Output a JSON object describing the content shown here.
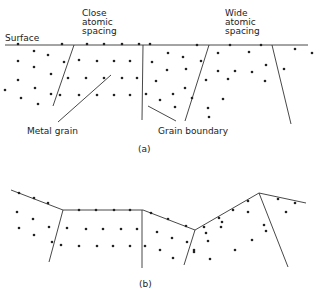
{
  "figure": {
    "panel_a": {
      "caption": "(a)",
      "labels": {
        "surface": "Surface",
        "close_spacing": [
          "Close",
          "atomic",
          "spacing"
        ],
        "wide_spacing": [
          "Wide",
          "atomic",
          "spacing"
        ],
        "metal_grain": "Metal grain",
        "grain_boundary": "Grain boundary"
      },
      "surface_line": [
        [
          5,
          45
        ],
        [
          308,
          45
        ]
      ],
      "boundaries": [
        [
          [
            74,
            45
          ],
          [
            53,
            106
          ]
        ],
        [
          [
            143,
            45
          ],
          [
            142,
            120
          ]
        ],
        [
          [
            209,
            45
          ],
          [
            185,
            121
          ]
        ],
        [
          [
            272,
            45
          ],
          [
            291,
            124
          ]
        ]
      ],
      "leaders": [
        [
          [
            111,
            75
          ],
          [
            58,
            122
          ]
        ],
        [
          [
            148,
            106
          ],
          [
            176,
            121
          ]
        ]
      ],
      "dots": [
        [
          18,
          44
        ],
        [
          62,
          44
        ],
        [
          87,
          44
        ],
        [
          104,
          44
        ],
        [
          122,
          44
        ],
        [
          139,
          44
        ],
        [
          150,
          44
        ],
        [
          197,
          45
        ],
        [
          230,
          45
        ],
        [
          261,
          45
        ],
        [
          34,
          51
        ],
        [
          48,
          55
        ],
        [
          18,
          61
        ],
        [
          34,
          67
        ],
        [
          64,
          62
        ],
        [
          79,
          60
        ],
        [
          97,
          61
        ],
        [
          114,
          61
        ],
        [
          130,
          61
        ],
        [
          152,
          62
        ],
        [
          168,
          53
        ],
        [
          183,
          57
        ],
        [
          201,
          61
        ],
        [
          218,
          53
        ],
        [
          249,
          52
        ],
        [
          295,
          49
        ],
        [
          312,
          53
        ],
        [
          51,
          74
        ],
        [
          68,
          78
        ],
        [
          86,
          78
        ],
        [
          104,
          78
        ],
        [
          122,
          78
        ],
        [
          137,
          78
        ],
        [
          167,
          70
        ],
        [
          186,
          69
        ],
        [
          218,
          71
        ],
        [
          235,
          71
        ],
        [
          266,
          65
        ],
        [
          284,
          69
        ],
        [
          18,
          80
        ],
        [
          35,
          88
        ],
        [
          5,
          90
        ],
        [
          21,
          98
        ],
        [
          51,
          94
        ],
        [
          60,
          95
        ],
        [
          79,
          95
        ],
        [
          97,
          95
        ],
        [
          114,
          95
        ],
        [
          130,
          95
        ],
        [
          146,
          94
        ],
        [
          156,
          81
        ],
        [
          173,
          94
        ],
        [
          185,
          88
        ],
        [
          206,
          80
        ],
        [
          228,
          79
        ],
        [
          252,
          72
        ],
        [
          265,
          81
        ],
        [
          38,
          104
        ],
        [
          160,
          100
        ],
        [
          175,
          107
        ],
        [
          192,
          98
        ],
        [
          208,
          108
        ],
        [
          223,
          99
        ],
        [
          209,
          117
        ]
      ]
    },
    "panel_b": {
      "caption": "(b)",
      "surface_polyline": [
        [
          11,
          190
        ],
        [
          63,
          210
        ],
        [
          143,
          210
        ],
        [
          195,
          230
        ],
        [
          259,
          193
        ],
        [
          306,
          203
        ]
      ],
      "boundaries": [
        [
          [
            63,
            210
          ],
          [
            49,
            262
          ]
        ],
        [
          [
            142,
            210
          ],
          [
            142,
            268
          ]
        ],
        [
          [
            195,
            230
          ],
          [
            184,
            265
          ]
        ],
        [
          [
            259,
            193
          ],
          [
            288,
            267
          ]
        ]
      ],
      "dots": [
        [
          19,
          193
        ],
        [
          34,
          198
        ],
        [
          48,
          203
        ],
        [
          79,
          210
        ],
        [
          96,
          210
        ],
        [
          114,
          210
        ],
        [
          130,
          210
        ],
        [
          151,
          213
        ],
        [
          168,
          219
        ],
        [
          186,
          226
        ],
        [
          204,
          227
        ],
        [
          219,
          218
        ],
        [
          233,
          210
        ],
        [
          248,
          201
        ],
        [
          278,
          199
        ],
        [
          295,
          203
        ],
        [
          17,
          212
        ],
        [
          33,
          219
        ],
        [
          19,
          228
        ],
        [
          34,
          235
        ],
        [
          49,
          227
        ],
        [
          67,
          228
        ],
        [
          86,
          229
        ],
        [
          103,
          229
        ],
        [
          121,
          229
        ],
        [
          137,
          229
        ],
        [
          157,
          232
        ],
        [
          172,
          238
        ],
        [
          187,
          242
        ],
        [
          206,
          233
        ],
        [
          222,
          222
        ],
        [
          248,
          212
        ],
        [
          264,
          225
        ],
        [
          286,
          212
        ],
        [
          52,
          242
        ],
        [
          61,
          245
        ],
        [
          79,
          246
        ],
        [
          97,
          246
        ],
        [
          113,
          246
        ],
        [
          130,
          246
        ],
        [
          145,
          246
        ],
        [
          160,
          250
        ],
        [
          173,
          258
        ],
        [
          194,
          250
        ],
        [
          208,
          241
        ],
        [
          221,
          227
        ],
        [
          252,
          240
        ],
        [
          266,
          231
        ],
        [
          194,
          252
        ],
        [
          210,
          259
        ],
        [
          235,
          250
        ]
      ]
    }
  }
}
